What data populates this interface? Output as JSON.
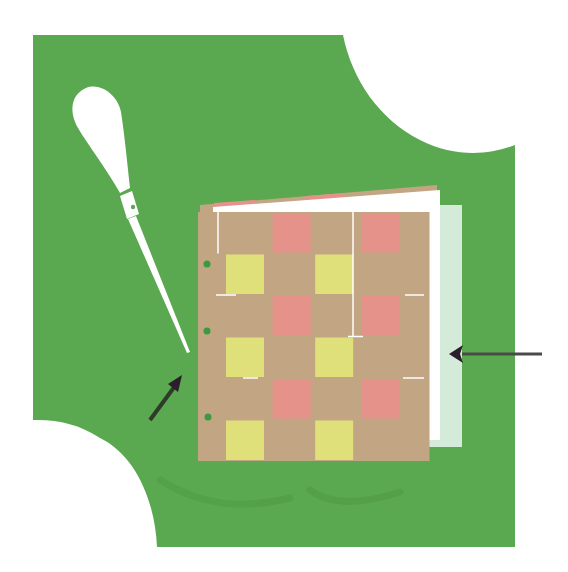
{
  "figure": {
    "title": "",
    "colors": {
      "background": "#ffffff",
      "backdrop_green": "#5aa84f",
      "backdrop_shadow": "#4f9a45",
      "weave_tan": "#c2a582",
      "weave_pink": "#e5928a",
      "weave_yellow": "#dfe07a",
      "page_white": "#ffffff",
      "back_page_mint": "#d3ebd8",
      "awl_white": "#ffffff",
      "arrow_dark": "#2a1f2a",
      "hole_green": "#3a9a42"
    }
  },
  "awl": {
    "label": "awl",
    "parts": [
      "handle",
      "ferrule",
      "needle"
    ]
  },
  "booklet": {
    "label": "woven paper booklet",
    "rows": 6,
    "columns": 5,
    "binding_holes": 3
  },
  "annotations": [
    {
      "id": "left-arrow",
      "text": "",
      "points_to": "awl tip / spine hole"
    },
    {
      "id": "right-arrow",
      "text": "",
      "points_to": "back page edge"
    }
  ]
}
